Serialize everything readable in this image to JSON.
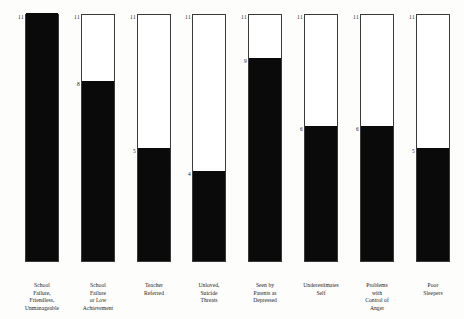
{
  "chart_data": {
    "type": "bar",
    "title": "",
    "subtitle": "",
    "xlabel": "",
    "ylabel": "",
    "ylim": [
      0,
      11
    ],
    "grid": false,
    "legend": null,
    "max_label": "11",
    "max_value": 11,
    "categories": [
      "School Failure, Friendless, Unmanageable",
      "School Failure or Low Achievement",
      "Teacher Referred",
      "Unloved, Suicide Threats",
      "Seen by Parents as Depressed",
      "Underestimates Self",
      "Problems with Control of Anger",
      "Poor Sleepers"
    ],
    "category_lines": [
      [
        "School",
        "Failure,",
        "Friendless,",
        "Unmanageable"
      ],
      [
        "School",
        "Failure",
        "or Low",
        "Achievement"
      ],
      [
        "Teacher",
        "Referred"
      ],
      [
        "Unloved,",
        "Suicide",
        "Threats"
      ],
      [
        "Seen by",
        "Parents as",
        "Depressed"
      ],
      [
        "Underestimates",
        "Self"
      ],
      [
        "Problems",
        "with",
        "Control of",
        "Anger"
      ],
      [
        "Poor",
        "Sleepers"
      ]
    ],
    "values": [
      11,
      8,
      5,
      4,
      9,
      6,
      6,
      5
    ],
    "value_labels": [
      "11",
      "8",
      "5",
      "4",
      "9",
      "6",
      "6",
      "5"
    ],
    "top_labels": [
      "11",
      "11",
      "11",
      "11",
      "11",
      "11",
      "11",
      "11"
    ],
    "colors": {
      "fill": "#0a0a0a",
      "outline": "#3a3a3a",
      "background": "#fdfdfb",
      "empty": "#ffffff",
      "text": "#1a1a1a"
    }
  }
}
